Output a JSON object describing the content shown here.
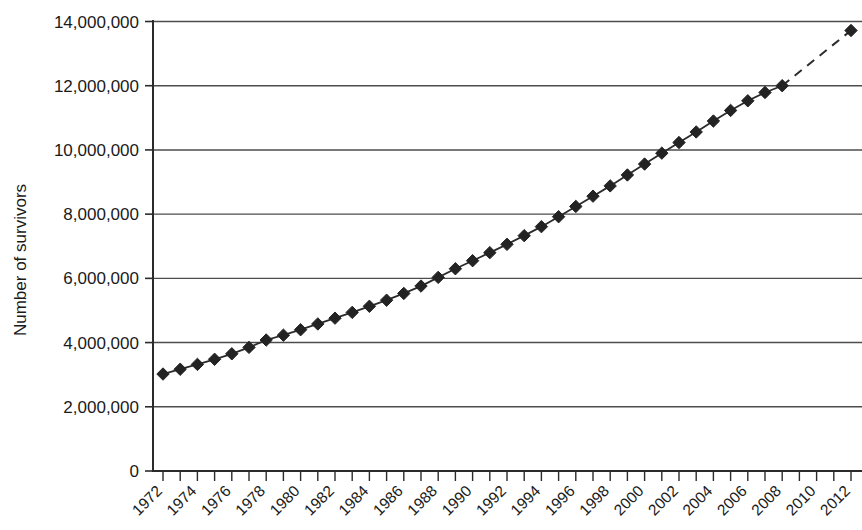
{
  "chart_data": {
    "type": "line",
    "title": "",
    "xlabel": "",
    "ylabel": "Number of survivors",
    "xlim": [
      1972,
      2012
    ],
    "ylim": [
      0,
      14000000
    ],
    "grid": true,
    "legend": "none",
    "y_ticks": [
      0,
      2000000,
      4000000,
      6000000,
      8000000,
      10000000,
      12000000,
      14000000
    ],
    "y_tick_labels": [
      "0",
      "2,000,000",
      "4,000,000",
      "6,000,000",
      "8,000,000",
      "10,000,000",
      "12,000,000",
      "14,000,000"
    ],
    "x_ticks": [
      1972,
      1973,
      1974,
      1975,
      1976,
      1977,
      1978,
      1979,
      1980,
      1981,
      1982,
      1983,
      1984,
      1985,
      1986,
      1987,
      1988,
      1989,
      1990,
      1991,
      1992,
      1993,
      1994,
      1995,
      1996,
      1997,
      1998,
      1999,
      2000,
      2001,
      2002,
      2003,
      2004,
      2005,
      2006,
      2007,
      2008,
      2009,
      2010,
      2011,
      2012
    ],
    "x_tick_labels": [
      "1972",
      "1974",
      "1976",
      "1978",
      "1980",
      "1982",
      "1984",
      "1986",
      "1988",
      "1990",
      "1992",
      "1994",
      "1996",
      "1998",
      "2000",
      "2002",
      "2004",
      "2006",
      "2008",
      "2010",
      "2012"
    ],
    "x_tick_label_years": [
      1972,
      1974,
      1976,
      1978,
      1980,
      1982,
      1984,
      1986,
      1988,
      1990,
      1992,
      1994,
      1996,
      1998,
      2000,
      2002,
      2004,
      2006,
      2008,
      2010,
      2012
    ],
    "x": [
      1972,
      1973,
      1974,
      1975,
      1976,
      1977,
      1978,
      1979,
      1980,
      1981,
      1982,
      1983,
      1984,
      1985,
      1986,
      1987,
      1988,
      1989,
      1990,
      1991,
      1992,
      1993,
      1994,
      1995,
      1996,
      1997,
      1998,
      1999,
      2000,
      2001,
      2002,
      2003,
      2004,
      2005,
      2006,
      2007,
      2008,
      2012
    ],
    "values": [
      3020000,
      3170000,
      3320000,
      3480000,
      3650000,
      3850000,
      4080000,
      4230000,
      4400000,
      4580000,
      4760000,
      4940000,
      5130000,
      5320000,
      5530000,
      5760000,
      6030000,
      6300000,
      6550000,
      6800000,
      7060000,
      7330000,
      7610000,
      7920000,
      8240000,
      8560000,
      8880000,
      9220000,
      9560000,
      9900000,
      10230000,
      10560000,
      10900000,
      11230000,
      11530000,
      11790000,
      12000000,
      13720000
    ],
    "solid_segment_end_index": 36,
    "dashed_projection": {
      "from_year": 2008,
      "from_value": 12000000,
      "to_year": 2012,
      "to_value": 13720000
    },
    "marker_shape": "diamond",
    "marker_color": "#232323",
    "line_color": "#2b2b2b",
    "grid_color": "#4d4d4d"
  }
}
